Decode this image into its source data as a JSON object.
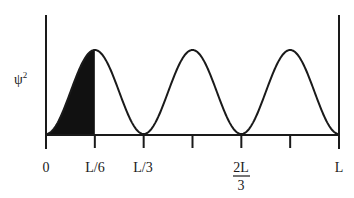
{
  "figure": {
    "y_label": "ψ",
    "y_label_sup": "2",
    "x_ticks": [
      {
        "pos": 0,
        "label": "0"
      },
      {
        "pos": 1,
        "label": "L/6"
      },
      {
        "pos": 2,
        "label": "L/3"
      },
      {
        "pos": 3,
        "label": ""
      },
      {
        "pos": 4,
        "label_num": "2L",
        "label_den": "3"
      },
      {
        "pos": 5,
        "label": ""
      },
      {
        "pos": 6,
        "label": "L"
      }
    ],
    "shaded_region": "0 to L/6",
    "colors": {
      "line": "#1a1a1a",
      "fill": "#111111",
      "background": "#ffffff"
    }
  },
  "chart_data": {
    "type": "line",
    "title": "",
    "xlabel": "",
    "ylabel": "ψ²",
    "function": "sin^2(3πx/L)",
    "x_range": [
      "0",
      "L"
    ],
    "x_tick_labels": [
      "0",
      "L/6",
      "L/3",
      "",
      "2L/3",
      "",
      "L"
    ],
    "peaks_at": [
      "L/6",
      "L/2",
      "5L/6"
    ],
    "nodes_at": [
      "0",
      "L/3",
      "2L/3",
      "L"
    ],
    "shaded_area": {
      "from": "0",
      "to": "L/6"
    },
    "grid": false
  }
}
